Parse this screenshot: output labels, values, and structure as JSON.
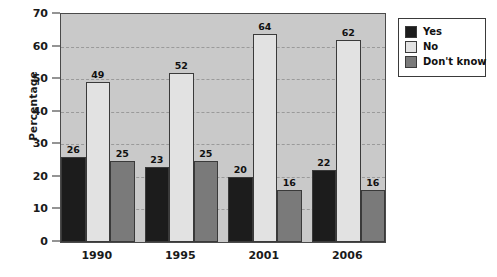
{
  "chart_data": {
    "type": "bar",
    "title": "",
    "xlabel": "",
    "ylabel": "Percentage",
    "ylim": [
      0,
      70
    ],
    "ytick_step": 10,
    "yticks": [
      0,
      10,
      20,
      30,
      40,
      50,
      60,
      70
    ],
    "grid": true,
    "grid_axis": "y",
    "legend_position": "right-top",
    "categories": [
      "1990",
      "1995",
      "2001",
      "2006"
    ],
    "series": [
      {
        "name": "Yes",
        "color": "#1c1c1c",
        "values": [
          26,
          23,
          20,
          22
        ]
      },
      {
        "name": "No",
        "color": "#e2e2e2",
        "values": [
          49,
          52,
          64,
          62
        ]
      },
      {
        "name": "Don't know",
        "color": "#7a7a7a",
        "values": [
          25,
          25,
          16,
          16
        ]
      }
    ],
    "data_labels": [
      {
        "category": "1990",
        "series": "Yes",
        "value": 26
      },
      {
        "category": "1990",
        "series": "No",
        "value": 49
      },
      {
        "category": "1990",
        "series": "Don't know",
        "value": 25
      },
      {
        "category": "1995",
        "series": "Yes",
        "value": 23
      },
      {
        "category": "1995",
        "series": "No",
        "value": 52
      },
      {
        "category": "1995",
        "series": "Don't know",
        "value": 25
      },
      {
        "category": "2001",
        "series": "Yes",
        "value": 20
      },
      {
        "category": "2001",
        "series": "No",
        "value": 64
      },
      {
        "category": "2001",
        "series": "Don't know",
        "value": 16
      },
      {
        "category": "2006",
        "series": "Yes",
        "value": 22
      },
      {
        "category": "2006",
        "series": "No",
        "value": 62
      },
      {
        "category": "2006",
        "series": "Don't know",
        "value": 16
      }
    ]
  },
  "colors": {
    "plot_background": "#c9c9c9",
    "page_background": "#ffffff",
    "axis": "#3a3a3a",
    "gridline": "#9a9a9a",
    "text": "#1a1a1a"
  }
}
